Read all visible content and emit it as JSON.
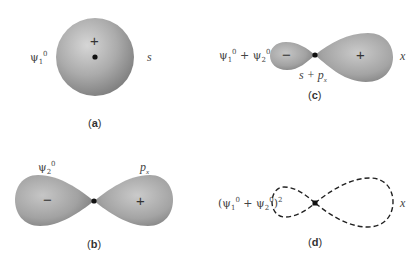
{
  "panels": {
    "a": {
      "caption_open": "(",
      "caption_letter": "a",
      "caption_close": ")",
      "left_label": {
        "base": "ψ",
        "sub": "1",
        "sup": "0"
      },
      "right_label": "s",
      "sign": "+"
    },
    "b": {
      "caption_open": "(",
      "caption_letter": "b",
      "caption_close": ")",
      "top_left_label": {
        "base": "ψ",
        "sub": "2",
        "sup": "0"
      },
      "top_right_label": {
        "base": "p",
        "sub": "x"
      },
      "left_sign": "−",
      "right_sign": "+"
    },
    "c": {
      "caption_open": "(",
      "caption_letter": "c",
      "caption_close": ")",
      "left_label": {
        "a": "ψ",
        "a_sub": "1",
        "a_sup": "0",
        "op": " + ",
        "b": "ψ",
        "b_sub": "2",
        "b_sup": "0"
      },
      "right_label": "x",
      "bottom_label": {
        "text": "s + p",
        "sub": "x"
      },
      "left_sign": "−",
      "right_sign": "+"
    },
    "d": {
      "caption_open": "(",
      "caption_letter": "d",
      "caption_close": ")",
      "left_label": {
        "open": "(",
        "a": "ψ",
        "a_sub": "1",
        "a_sup": "0",
        "op": " + ",
        "b": "ψ",
        "b_sub": "2",
        "b_sup": "0",
        "close": ")",
        "power": "2"
      },
      "right_label": "x"
    }
  },
  "colors": {
    "shape_light": "#d4d4d4",
    "shape_mid": "#a8a8a8",
    "shape_dark": "#7a7a7a",
    "node": "#111111",
    "dash": "#222222"
  }
}
